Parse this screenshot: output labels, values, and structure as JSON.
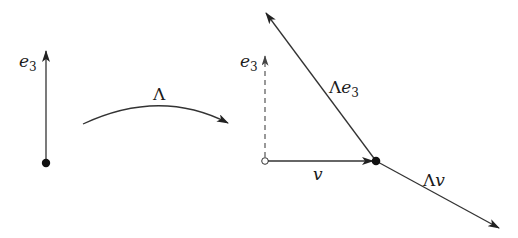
{
  "diagram": {
    "left_panel": {
      "vector_label": "e",
      "vector_subscript": "3"
    },
    "transform": {
      "label": "Λ"
    },
    "right_panel": {
      "dashed_vector_label": "e",
      "dashed_vector_subscript": "3",
      "velocity_label": "v",
      "transformed_e3_label_prefix": "Λ",
      "transformed_e3_label_var": "e",
      "transformed_e3_label_subscript": "3",
      "transformed_v_label_prefix": "Λ",
      "transformed_v_label_var": "v"
    },
    "colors": {
      "stroke": "#333333",
      "dashed": "#555555",
      "point": "#111111",
      "background": "#ffffff"
    }
  }
}
